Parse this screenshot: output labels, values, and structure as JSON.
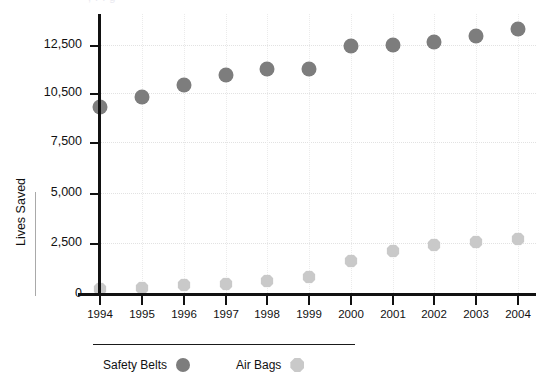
{
  "title_sliver": ", .  .  g",
  "axis": {
    "ylabel": "Lives Saved",
    "xlabel": "",
    "y_ticks": [
      "0",
      "2,500",
      "5,000",
      "7,500",
      "10,500",
      "12,500"
    ],
    "y_tick_values": [
      0,
      2500,
      5000,
      7500,
      10500,
      12500
    ],
    "x_ticks": [
      "1994",
      "1995",
      "1996",
      "1997",
      "1998",
      "1999",
      "2000",
      "2001",
      "2002",
      "2003",
      "2004"
    ]
  },
  "legend": {
    "position": "bottom-left",
    "items": [
      {
        "label": "Safety Belts",
        "marker": "circle",
        "color": "#7d7d7d"
      },
      {
        "label": "Air Bags",
        "marker": "octagon",
        "color": "#c9c9c9"
      }
    ]
  },
  "colors": {
    "safety_belts": "#7d7d7d",
    "air_bags": "#c9c9c9",
    "axis": "#111111",
    "grid": "#e2e2e2",
    "background": "#ffffff"
  },
  "chart_data": {
    "type": "scatter",
    "title": "",
    "subtitle": "",
    "xlabel": "",
    "ylabel": "Lives Saved",
    "categories": [
      "1994",
      "1995",
      "1996",
      "1997",
      "1998",
      "1999",
      "2000",
      "2001",
      "2002",
      "2003",
      "2004"
    ],
    "x": [
      1994,
      1995,
      1996,
      1997,
      1998,
      1999,
      2000,
      2001,
      2002,
      2003,
      2004
    ],
    "series": [
      {
        "name": "Safety Belts",
        "marker": "circle",
        "color": "#7d7d7d",
        "values": [
          9300,
          10100,
          10750,
          11150,
          11350,
          11350,
          12350,
          12450,
          12600,
          12800,
          13150
        ]
      },
      {
        "name": "Air Bags",
        "marker": "octagon",
        "color": "#c9c9c9",
        "values": [
          250,
          300,
          400,
          430,
          550,
          700,
          1300,
          1900,
          2350,
          2550,
          2750
        ]
      }
    ],
    "ylim": [
      0,
      13500
    ],
    "y_ticks": [
      0,
      2500,
      5000,
      7500,
      10500,
      12500
    ],
    "grid": true,
    "legend_position": "bottom-left"
  },
  "pixel_map": {
    "y_tick_px": [
      294,
      243,
      193,
      142,
      93,
      45
    ],
    "x_tick_px": [
      100,
      142,
      184,
      226,
      267,
      309,
      351,
      393,
      434,
      476,
      518
    ],
    "safety_belts_px": [
      107,
      97,
      85,
      75,
      69,
      69,
      46,
      45,
      42,
      36,
      29
    ],
    "air_bags_px": [
      289,
      288,
      285,
      284,
      281,
      277,
      261,
      251,
      245,
      242,
      239
    ]
  }
}
